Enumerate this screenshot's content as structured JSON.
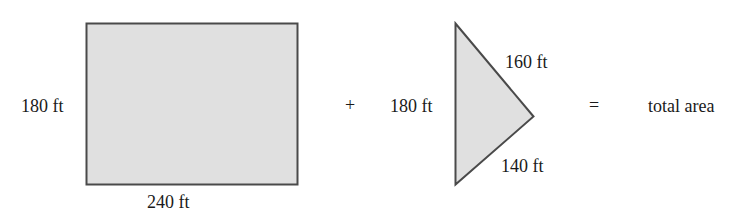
{
  "diagram": {
    "colors": {
      "fill": "#e0e0e0",
      "stroke": "#4a4a4a",
      "text": "#1a1a1a"
    },
    "rectangle": {
      "height_label": "180 ft",
      "width_label": "240 ft"
    },
    "operator_plus": "+",
    "triangle": {
      "left_side_label": "180 ft",
      "upper_side_label": "160 ft",
      "lower_side_label": "140 ft"
    },
    "operator_equals": "=",
    "result_label": "total area"
  }
}
